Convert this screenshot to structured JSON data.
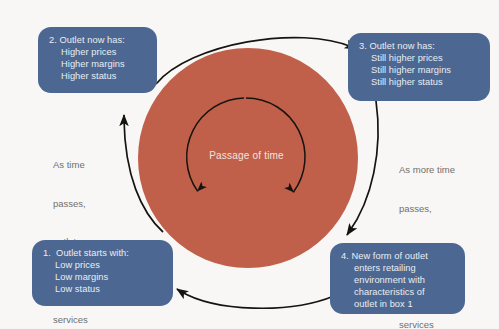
{
  "diagram": {
    "background_color": "#f8f7f5",
    "center": {
      "label": "Passage of time",
      "disc_color": "#c0604a",
      "text_color": "#f3e3dd"
    },
    "box_color": "#4c6892",
    "box_text_color": "#e9edf3",
    "annotation_color": "#6f6f70",
    "arrow_color": "#17140f",
    "boxes": [
      {
        "id": "box-1",
        "number": "1.",
        "heading": "1.  Outlet starts with:",
        "lines": [
          "1.  Outlet starts with:",
          "Low prices",
          "Low margins",
          "Low status"
        ]
      },
      {
        "id": "box-2",
        "number": "2.",
        "heading": "2. Outlet now has:",
        "lines": [
          "2. Outlet now has:",
          "Higher prices",
          "Higher margins",
          "Higher status"
        ]
      },
      {
        "id": "box-3",
        "number": "3.",
        "heading": "3. Outlet now has:",
        "lines": [
          "3. Outlet now has:",
          "Still higher prices",
          "Still higher margins",
          "Still higher status"
        ]
      },
      {
        "id": "box-4",
        "number": "4.",
        "heading": "4. New form of outlet",
        "lines": [
          "4. New form of outlet",
          "enters retailing",
          "environment with",
          "characteristics of",
          "outlet in box 1"
        ]
      }
    ],
    "annotations": [
      {
        "id": "annot-left",
        "lines": [
          "As time",
          "passes,",
          "outlet",
          "adds",
          "services"
        ]
      },
      {
        "id": "annot-right",
        "lines": [
          "As more time",
          "passes,",
          "outlet adds",
          "still more",
          "services"
        ]
      }
    ]
  }
}
